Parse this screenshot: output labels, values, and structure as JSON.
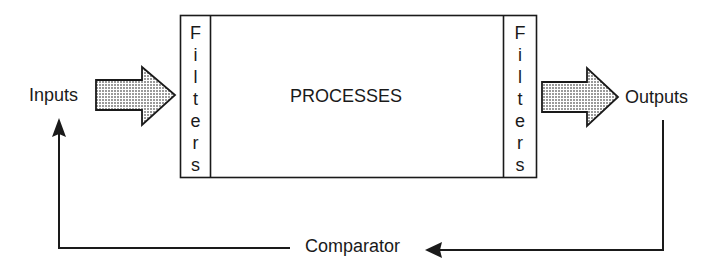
{
  "diagram": {
    "type": "system-process-block-diagram",
    "nodes": {
      "inputs": {
        "label": "Inputs"
      },
      "input_filter": {
        "label": "Filters",
        "letters": [
          "F",
          "i",
          "l",
          "t",
          "e",
          "r",
          "s"
        ]
      },
      "processes": {
        "label": "PROCESSES"
      },
      "output_filter": {
        "label": "Filters",
        "letters": [
          "F",
          "i",
          "l",
          "t",
          "e",
          "r",
          "s"
        ]
      },
      "outputs": {
        "label": "Outputs"
      },
      "comparator": {
        "label": "Comparator"
      }
    },
    "edges": [
      {
        "from": "inputs",
        "to": "input_filter",
        "style": "block-arrow-stippled"
      },
      {
        "from": "output_filter",
        "to": "outputs",
        "style": "block-arrow-stippled"
      },
      {
        "from": "outputs",
        "to": "comparator",
        "style": "line-arrow"
      },
      {
        "from": "comparator",
        "to": "inputs",
        "style": "line-arrow"
      }
    ],
    "colors": {
      "stroke": "#1a1a1a",
      "stipple_fill": "#cfcfcf",
      "background": "#ffffff"
    }
  }
}
